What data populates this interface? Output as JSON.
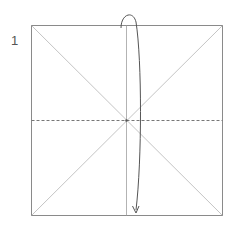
{
  "diagram": {
    "step_number": "1",
    "square": {
      "x": 31,
      "y": 25,
      "size": 191
    },
    "colors": {
      "outline": "#8a8a8a",
      "diagonal": "#b0b0b0",
      "dashed": "#777777",
      "arrow": "#555555"
    },
    "fold": {
      "type": "valley-fold",
      "direction": "top edge folds down to bottom edge"
    }
  }
}
